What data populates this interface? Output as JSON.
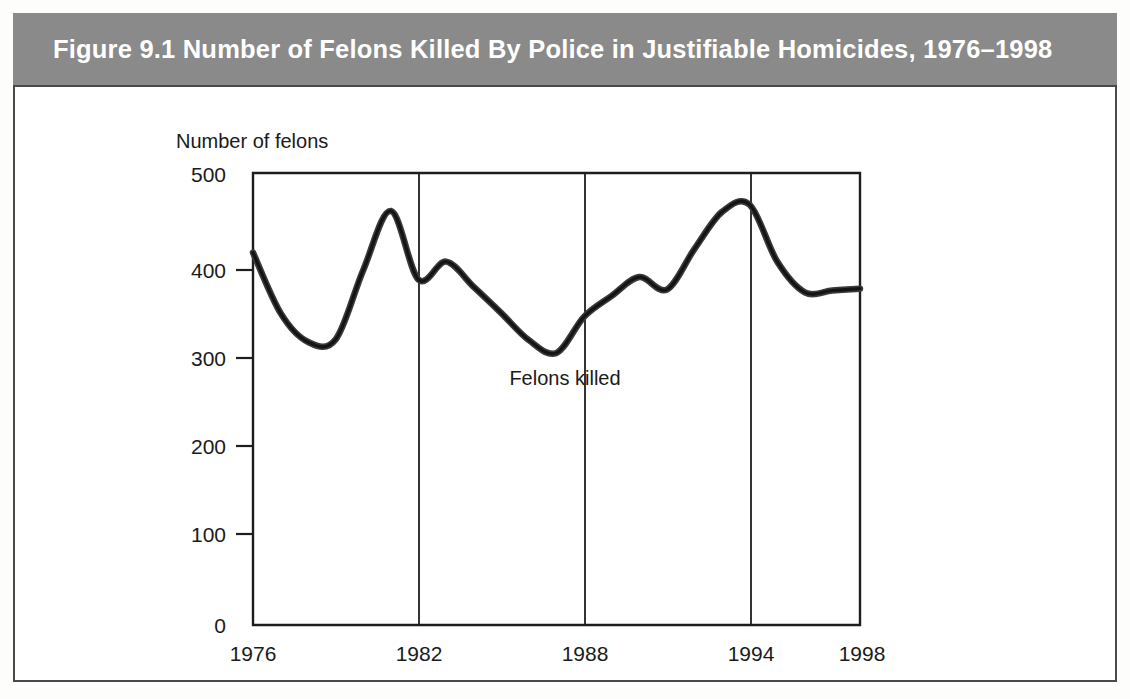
{
  "figure": {
    "title": "Figure 9.1   Number of Felons Killed By Police in Justifiable Homicides, 1976–1998",
    "title_bar_color": "#8a8a8a",
    "title_text_color": "#ffffff",
    "frame_border_color": "#4a4a4a"
  },
  "chart_data": {
    "type": "line",
    "title": "Figure 9.1   Number of Felons Killed By Police in Justifiable Homicides, 1976–1998",
    "xlabel": "",
    "ylabel": "Number of felons",
    "ylim": [
      0,
      500
    ],
    "xlim": [
      1976,
      1998
    ],
    "yticks": [
      0,
      100,
      200,
      300,
      400,
      500
    ],
    "ytick_labels": [
      "0",
      "100",
      "200",
      "300",
      "400",
      "500"
    ],
    "xticks": [
      1976,
      1982,
      1988,
      1994,
      1998
    ],
    "xtick_labels": [
      "1976",
      "1982",
      "1988",
      "1994",
      "1998"
    ],
    "grid": "vertical-only",
    "gridline_years": [
      1982,
      1988,
      1994
    ],
    "legend_position": "inline-annotation",
    "series": [
      {
        "name": "Felons killed",
        "annotation": "Felons killed",
        "line_color": "#2a2a2a",
        "x": [
          1976,
          1977,
          1978,
          1979,
          1980,
          1981,
          1982,
          1983,
          1984,
          1985,
          1986,
          1987,
          1988,
          1989,
          1990,
          1991,
          1992,
          1993,
          1994,
          1995,
          1996,
          1997,
          1998
        ],
        "values": [
          412,
          345,
          313,
          316,
          393,
          458,
          382,
          402,
          374,
          345,
          315,
          301,
          341,
          364,
          385,
          371,
          416,
          457,
          465,
          402,
          368,
          370,
          372
        ]
      }
    ]
  },
  "annotations": {
    "y_axis_caption": "Number of felons",
    "series_inline_label": "Felons killed"
  }
}
